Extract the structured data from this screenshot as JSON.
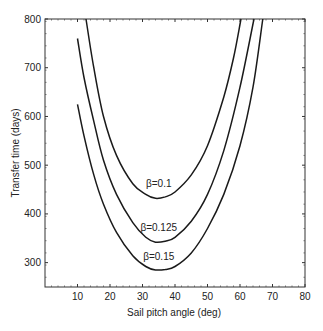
{
  "chart_data": {
    "type": "line",
    "title": "",
    "xlabel": "Sail pitch angle (deg)",
    "ylabel": "Transfer time (days)",
    "xlim": [
      0,
      80
    ],
    "ylim": [
      250,
      800
    ],
    "xticks": [
      10,
      20,
      30,
      40,
      50,
      60,
      70,
      80
    ],
    "yticks": [
      300,
      400,
      500,
      600,
      700,
      800
    ],
    "grid": false,
    "legend": "inline labels",
    "series": [
      {
        "name": "β=0.1",
        "label_at": [
          35,
          455
        ],
        "points": [
          [
            12.6,
            800
          ],
          [
            15,
            700
          ],
          [
            18,
            600
          ],
          [
            22,
            520
          ],
          [
            27,
            462
          ],
          [
            31,
            440
          ],
          [
            34,
            432
          ],
          [
            37,
            435
          ],
          [
            40,
            445
          ],
          [
            45,
            480
          ],
          [
            50,
            540
          ],
          [
            55,
            640
          ],
          [
            58,
            720
          ],
          [
            60.3,
            800
          ]
        ]
      },
      {
        "name": "β=0.125",
        "label_at": [
          35,
          365
        ],
        "points": [
          [
            10,
            760
          ],
          [
            12,
            680
          ],
          [
            15,
            590
          ],
          [
            18,
            510
          ],
          [
            22,
            440
          ],
          [
            27,
            382
          ],
          [
            31,
            352
          ],
          [
            34,
            342
          ],
          [
            37,
            344
          ],
          [
            40,
            352
          ],
          [
            45,
            385
          ],
          [
            50,
            440
          ],
          [
            55,
            530
          ],
          [
            60,
            660
          ],
          [
            64.3,
            800
          ]
        ]
      },
      {
        "name": "β=0.15",
        "label_at": [
          35,
          305
        ],
        "points": [
          [
            10,
            625
          ],
          [
            12,
            560
          ],
          [
            15,
            480
          ],
          [
            18,
            420
          ],
          [
            22,
            362
          ],
          [
            27,
            314
          ],
          [
            31,
            292
          ],
          [
            34,
            285
          ],
          [
            37,
            286
          ],
          [
            40,
            292
          ],
          [
            45,
            320
          ],
          [
            50,
            370
          ],
          [
            55,
            440
          ],
          [
            60,
            540
          ],
          [
            64,
            660
          ],
          [
            67,
            800
          ]
        ]
      }
    ]
  }
}
